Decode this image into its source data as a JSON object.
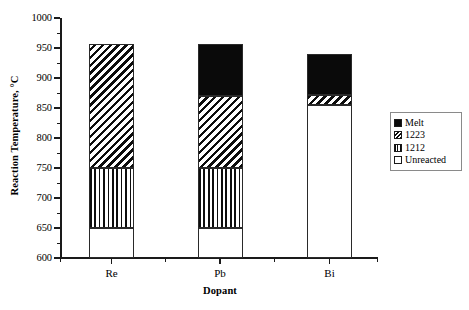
{
  "chart_data": {
    "type": "bar",
    "subtype": "stacked",
    "title": "",
    "xlabel": "Dopant",
    "ylabel": "Reaction Temperature, °C",
    "categories": [
      "Re",
      "Pb",
      "Bi"
    ],
    "ylim": [
      600,
      1000
    ],
    "ytick_step": 50,
    "yticks": [
      600,
      650,
      700,
      750,
      800,
      850,
      900,
      950,
      1000
    ],
    "ytick_labels": [
      "600",
      "650",
      "700",
      "750",
      "800",
      "850",
      "900",
      "950",
      "1000"
    ],
    "grid": false,
    "legend_position": "right",
    "series": [
      {
        "name": "Melt",
        "pattern": "solid-black",
        "color": "#0a0a0a",
        "bounds": [
          {
            "category": "Re",
            "start": null,
            "end": null
          },
          {
            "category": "Pb",
            "start": 870,
            "end": 957
          },
          {
            "category": "Bi",
            "start": 872,
            "end": 940
          }
        ]
      },
      {
        "name": "1223",
        "pattern": "diagonal-hatch",
        "color": "#0d0d0d",
        "bounds": [
          {
            "category": "Re",
            "start": 750,
            "end": 957
          },
          {
            "category": "Pb",
            "start": 750,
            "end": 870
          },
          {
            "category": "Bi",
            "start": 855,
            "end": 872
          }
        ]
      },
      {
        "name": "1212",
        "pattern": "vertical-hatch",
        "color": "#0d0d0d",
        "bounds": [
          {
            "category": "Re",
            "start": 650,
            "end": 750
          },
          {
            "category": "Pb",
            "start": 650,
            "end": 750
          },
          {
            "category": "Bi",
            "start": null,
            "end": null
          }
        ]
      },
      {
        "name": "Unreacted",
        "pattern": "empty-white",
        "color": "#ffffff",
        "bounds": [
          {
            "category": "Re",
            "start": 600,
            "end": 650
          },
          {
            "category": "Pb",
            "start": 600,
            "end": 650
          },
          {
            "category": "Bi",
            "start": 600,
            "end": 855
          }
        ]
      }
    ]
  },
  "axes": {
    "y_title": "Reaction Temperature, °C",
    "x_title": "Dopant",
    "y_labels": [
      "1000",
      "950",
      "900",
      "850",
      "800",
      "750",
      "700",
      "650",
      "600"
    ],
    "x_labels": [
      "Re",
      "Pb",
      "Bi"
    ]
  },
  "legend": {
    "entries": [
      {
        "label": "Melt",
        "swatch": "melt-swatch"
      },
      {
        "label": "1223",
        "swatch": "hatch-1223-swatch"
      },
      {
        "label": "1212",
        "swatch": "hatch-1212-swatch"
      },
      {
        "label": "Unreacted",
        "swatch": "unreacted-swatch"
      }
    ]
  }
}
